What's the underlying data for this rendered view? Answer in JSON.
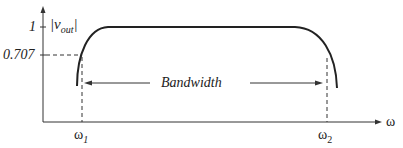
{
  "diagram": {
    "y_axis_label_prefix": "|v",
    "y_axis_label_sub": "out",
    "y_axis_label_suffix": "|",
    "y_tick_top": "1",
    "y_tick_half_power": "0.707",
    "x_axis_label": "ω",
    "omega1_base": "ω",
    "omega1_sub": "1",
    "omega2_base": "ω",
    "omega2_sub": "2",
    "bandwidth_label": "Bandwidth",
    "colors": {
      "line": "#222222",
      "background": "#ffffff"
    }
  }
}
